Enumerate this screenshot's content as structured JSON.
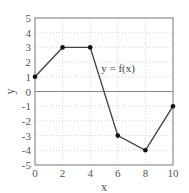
{
  "chart_data": {
    "type": "line",
    "title": "",
    "xlabel": "x",
    "ylabel": "y",
    "xlim": [
      0,
      10
    ],
    "ylim": [
      -5,
      5
    ],
    "xticks": [
      0,
      2,
      4,
      6,
      8,
      10
    ],
    "yticks": [
      -5,
      -4,
      -3,
      -2,
      -1,
      0,
      1,
      2,
      3,
      4,
      5
    ],
    "grid": true,
    "grid_style": "dotted",
    "legend": null,
    "series": [
      {
        "name": "y = f(x)",
        "x": [
          0,
          2,
          4,
          6,
          8,
          10
        ],
        "values": [
          1,
          3,
          3,
          -3,
          -4,
          -1
        ],
        "markers": true
      }
    ],
    "annotations": [
      {
        "text": "y = f(x)",
        "x": 4.8,
        "y": 1.6
      }
    ],
    "reference_lines": [
      {
        "axis": "y",
        "value": 0
      }
    ]
  },
  "colors": {
    "line": "#444444",
    "frame": "#777777",
    "grid": "#cccccc",
    "zero_line": "#888888"
  }
}
